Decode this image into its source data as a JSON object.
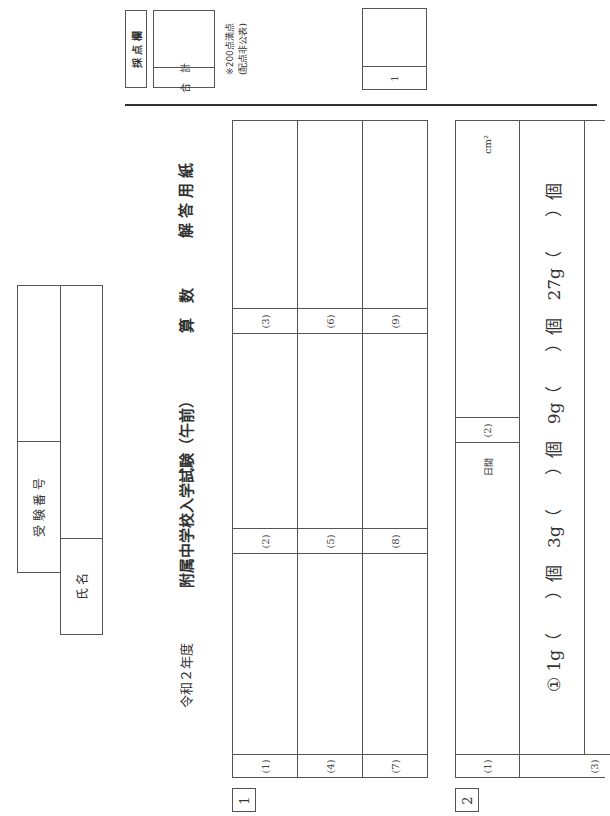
{
  "scoring": {
    "header_label": "採 点 欄",
    "total_label": "合　計",
    "note_line1": "※200点満点",
    "note_line2": "(配点非公表)",
    "section_score_label": "1"
  },
  "id_block": {
    "exam_number_label": "受 験 番 号",
    "name_label": "氏 名",
    "exam_number_value": "",
    "name_value": ""
  },
  "title": {
    "year": "令和２年度",
    "exam": "附属中学校入学試験（午前）",
    "subject": "算　数",
    "sheet": "解 答 用 紙"
  },
  "section1": {
    "number": "1",
    "cells": [
      {
        "label": "(1)",
        "value": ""
      },
      {
        "label": "(2)",
        "value": ""
      },
      {
        "label": "(3)",
        "value": ""
      },
      {
        "label": "(4)",
        "value": ""
      },
      {
        "label": "(5)",
        "value": ""
      },
      {
        "label": "(6)",
        "value": ""
      },
      {
        "label": "(7)",
        "value": ""
      },
      {
        "label": "(8)",
        "value": ""
      },
      {
        "label": "(9)",
        "value": ""
      }
    ]
  },
  "section2": {
    "number": "2",
    "q1": {
      "label": "(1)",
      "unit": "日間",
      "value": ""
    },
    "q2": {
      "label": "(2)",
      "unit": "cm²",
      "value": ""
    },
    "q3": {
      "label": "(3)",
      "line": "① 1g（　　）個　3g（　　）個　9g（　　）個　27g（　　）個"
    }
  }
}
